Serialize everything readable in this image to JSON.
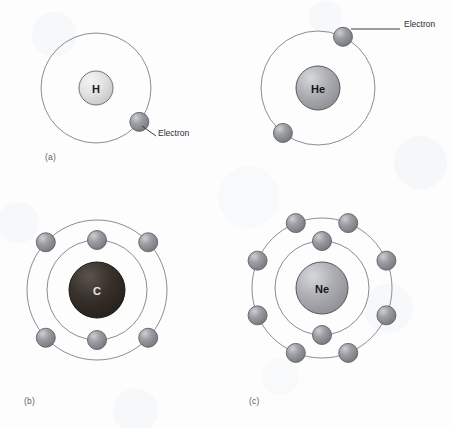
{
  "figure": {
    "width": 452,
    "height": 428,
    "background_color": "#fdfdfe"
  },
  "style": {
    "orbit_stroke": "#8a8d93",
    "orbit_stroke_width": 1.0,
    "electron_fill": "#8e9096",
    "electron_highlight": "#c9cbcf",
    "electron_stroke": "#5e6166",
    "electron_radius": 9.5,
    "leader_line_color": "#3a3c40",
    "label_color": "#2b2d31",
    "panel_label_color": "#5d6066"
  },
  "callouts": [
    {
      "id": "electron-callout-a",
      "text": "Electron",
      "x": 158,
      "y": 134,
      "line": {
        "x1": 142,
        "y1": 126,
        "x2": 156,
        "y2": 136
      }
    },
    {
      "id": "electron-callout-b",
      "text": "Electron",
      "x": 404,
      "y": 25,
      "line": {
        "x1": 351,
        "y1": 29,
        "x2": 400,
        "y2": 29
      }
    }
  ],
  "panels": [
    {
      "id": "panel-a",
      "label": "(a)",
      "label_x": 45,
      "label_y": 152,
      "element": "H",
      "element_name": "Hydrogen",
      "center": {
        "x": 96,
        "y": 88
      },
      "nucleus": {
        "radius": 17,
        "fill": "#dcdcdc",
        "highlight": "#f3f3f3",
        "stroke": "#6e7075",
        "text_color": "#1b1d20",
        "font_size": 11
      },
      "shells": [
        {
          "radius": 55,
          "electron_count": 1,
          "electrons": [
            {
              "angle_deg": 38
            }
          ]
        }
      ]
    },
    {
      "id": "panel-b",
      "label": "",
      "element": "He",
      "element_name": "Helium",
      "center": {
        "x": 318,
        "y": 88
      },
      "nucleus": {
        "radius": 22,
        "fill": "#a7a9ad",
        "highlight": "#d4d6d9",
        "stroke": "#56585c",
        "text_color": "#14161a",
        "font_size": 11
      },
      "shells": [
        {
          "radius": 57,
          "electron_count": 2,
          "electrons": [
            {
              "angle_deg": -64
            },
            {
              "angle_deg": 128
            }
          ]
        }
      ]
    },
    {
      "id": "panel-c",
      "label": "(b)",
      "label_x": 24,
      "label_y": 396,
      "element": "C",
      "element_name": "Carbon",
      "center": {
        "x": 97,
        "y": 290
      },
      "nucleus": {
        "radius": 28,
        "fill": "#332b25",
        "highlight": "#57504a",
        "stroke": "#1a1613",
        "text_color": "#e8e8e8",
        "font_size": 11
      },
      "shells": [
        {
          "radius": 50,
          "electron_count": 2,
          "electrons": [
            {
              "angle_deg": -90
            },
            {
              "angle_deg": 90
            }
          ]
        },
        {
          "radius": 70,
          "electron_count": 4,
          "electrons": [
            {
              "angle_deg": -137
            },
            {
              "angle_deg": -43
            },
            {
              "angle_deg": 137
            },
            {
              "angle_deg": 43
            }
          ]
        }
      ]
    },
    {
      "id": "panel-d",
      "label": "(c)",
      "label_x": 249,
      "label_y": 396,
      "element": "Ne",
      "element_name": "Neon",
      "center": {
        "x": 322,
        "y": 288
      },
      "nucleus": {
        "radius": 26,
        "fill": "#a7a9ad",
        "highlight": "#d4d6d9",
        "stroke": "#56585c",
        "text_color": "#14161a",
        "font_size": 11
      },
      "shells": [
        {
          "radius": 47,
          "electron_count": 2,
          "electrons": [
            {
              "angle_deg": -90
            },
            {
              "angle_deg": 90
            }
          ]
        },
        {
          "radius": 70,
          "electron_count": 8,
          "electrons": [
            {
              "angle_deg": -112
            },
            {
              "angle_deg": -68
            },
            {
              "angle_deg": -157
            },
            {
              "angle_deg": -23
            },
            {
              "angle_deg": 157
            },
            {
              "angle_deg": 23
            },
            {
              "angle_deg": 112
            },
            {
              "angle_deg": 68
            }
          ]
        }
      ]
    }
  ]
}
